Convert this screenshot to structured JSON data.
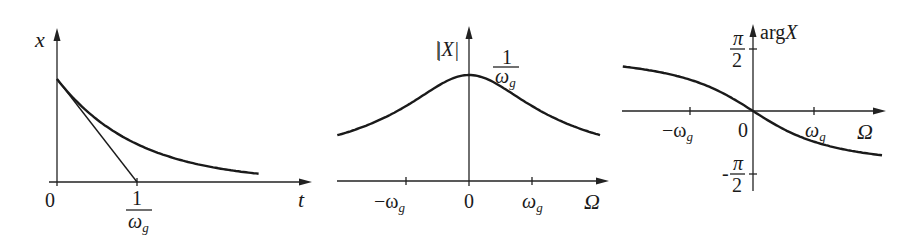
{
  "figure": {
    "panels": [
      {
        "id": "time-domain",
        "y_label": "x",
        "x_label": "t",
        "origin_label": "0",
        "tick_label": {
          "numerator": "1",
          "denominator": "ω",
          "denominator_sub": "g"
        },
        "curve": "exponential decay x(t) = e^{-ω_g t}",
        "tangent": "tangent at t=0 intersects t-axis at 1/ω_g"
      },
      {
        "id": "magnitude",
        "y_label": "|X|",
        "x_label": "Ω",
        "peak_label": {
          "numerator": "1",
          "denominator": "ω",
          "denominator_sub": "g"
        },
        "ticks": [
          {
            "label": "−ω",
            "sub": "g"
          },
          {
            "label": "0",
            "sub": ""
          },
          {
            "label": "ω",
            "sub": "g"
          }
        ],
        "curve": "|X(Ω)| = 1/sqrt(ω_g² + Ω²)"
      },
      {
        "id": "phase",
        "y_label": "argX",
        "y_label_prefix": "arg",
        "y_label_var": "X",
        "x_label": "Ω",
        "y_ticks": [
          {
            "sign": "",
            "numerator": "π",
            "denominator": "2"
          },
          {
            "sign": "-",
            "numerator": "π",
            "denominator": "2"
          }
        ],
        "x_ticks": [
          {
            "label": "−ω",
            "sub": "g"
          },
          {
            "label": "0",
            "sub": ""
          },
          {
            "label": "ω",
            "sub": "g"
          }
        ],
        "curve": "arg X(Ω) = −arctan(Ω/ω_g)"
      }
    ]
  },
  "chart_data": [
    {
      "type": "line",
      "title": "",
      "xlabel": "t",
      "ylabel": "x",
      "x_unit": "1/ω_g",
      "xlim": [
        0,
        3.3
      ],
      "ylim": [
        0,
        1.25
      ],
      "series": [
        {
          "name": "x(t)",
          "x": [
            0,
            0.5,
            1,
            1.5,
            2,
            2.5
          ],
          "y": [
            1,
            0.61,
            0.37,
            0.22,
            0.14,
            0.08
          ]
        },
        {
          "name": "tangent",
          "x": [
            0,
            1
          ],
          "y": [
            1,
            0
          ]
        }
      ]
    },
    {
      "type": "line",
      "title": "",
      "xlabel": "Ω",
      "ylabel": "|X|",
      "x_unit": "ω_g",
      "xlim": [
        -2.2,
        2.2
      ],
      "ylim": [
        0,
        1.25
      ],
      "series": [
        {
          "name": "|X|",
          "x": [
            -2.1,
            -1,
            0,
            1,
            2.1
          ],
          "y": [
            0.43,
            0.71,
            1,
            0.71,
            0.43
          ]
        }
      ]
    },
    {
      "type": "line",
      "title": "",
      "xlabel": "Ω",
      "ylabel": "argX",
      "x_unit": "ω_g",
      "y_unit": "π/2",
      "xlim": [
        -2.2,
        2.2
      ],
      "ylim": [
        -1.25,
        1.25
      ],
      "series": [
        {
          "name": "argX",
          "x": [
            -2.1,
            -1,
            0,
            1,
            2.1
          ],
          "y": [
            0.72,
            0.5,
            0,
            -0.5,
            -0.72
          ]
        }
      ]
    }
  ]
}
